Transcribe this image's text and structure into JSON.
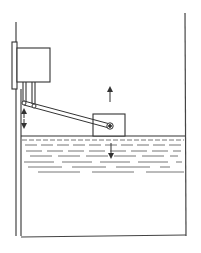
{
  "diagram": {
    "title": "",
    "type": "float-level-switch-in-tank",
    "colors": {
      "stroke": "#333333",
      "liquid_lines": "#555555",
      "background": "#ffffff"
    },
    "tank": {
      "left_x": 16,
      "right_x": 185,
      "top_left_y": 22,
      "top_right_y": 13,
      "bottom_y": 236
    },
    "liquid": {
      "surface_y": 136
    },
    "switch_housing": {
      "x": 17,
      "y": 48,
      "w": 33,
      "h": 34
    },
    "mount_plate": {
      "x": 12,
      "y": 42,
      "w": 5,
      "h": 47
    },
    "float": {
      "x": 93,
      "y": 114,
      "w": 32,
      "h": 22
    },
    "lever": {
      "x1": 24,
      "y1": 103,
      "x2": 110,
      "y2": 126
    },
    "arrows": [
      {
        "name": "float-rise-arrow",
        "direction": "up",
        "x": 110,
        "y1": 102,
        "y2": 87
      },
      {
        "name": "liquid-fall-arrow",
        "direction": "down",
        "x": 111,
        "y1": 143,
        "y2": 157
      },
      {
        "name": "rod-travel-arrow",
        "direction": "both",
        "x": 24,
        "y1": 111,
        "y2": 126
      }
    ],
    "labels": []
  }
}
